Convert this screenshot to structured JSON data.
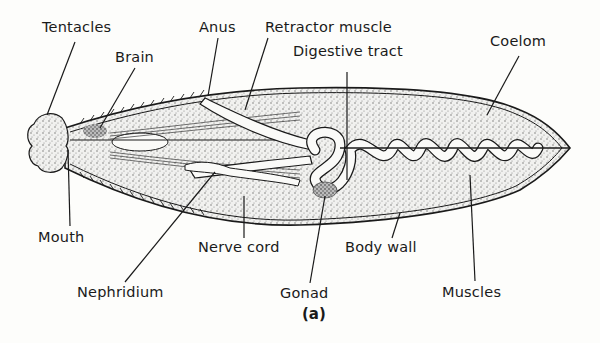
{
  "figure": {
    "caption": "(a)",
    "labels": {
      "tentacles": "Tentacles",
      "brain": "Brain",
      "anus": "Anus",
      "retractor_muscle": "Retractor muscle",
      "digestive_tract": "Digestive tract",
      "coelom": "Coelom",
      "mouth": "Mouth",
      "nerve_cord": "Nerve cord",
      "body_wall": "Body wall",
      "nephridium": "Nephridium",
      "gonad": "Gonad",
      "muscles": "Muscles"
    }
  },
  "colors": {
    "ink": "#1a1a1a",
    "paper": "#fdfdfb",
    "stipple": "#cfcfcf"
  }
}
